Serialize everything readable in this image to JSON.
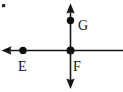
{
  "figure": {
    "background_color": "#ffffff",
    "ink_color": "#161616",
    "width": 123,
    "height": 92,
    "labels": {
      "e": "E",
      "f": "F",
      "g": "G"
    },
    "label_positions": {
      "e": {
        "x": 18,
        "y": 71
      },
      "f": {
        "x": 73,
        "y": 71
      },
      "g": {
        "x": 78,
        "y": 30
      }
    },
    "points": [
      {
        "name": "E",
        "x": 23,
        "y": 50.5,
        "radius": 3.7
      },
      {
        "name": "F",
        "x": 70.5,
        "y": 50.5,
        "radius": 4.0
      },
      {
        "name": "G",
        "x": 70.5,
        "y": 20.5,
        "radius": 3.7
      }
    ],
    "lines": [
      {
        "name": "horizontal-line",
        "x1": 3,
        "y1": 50.5,
        "x2": 123,
        "y2": 50.5,
        "arrow_start": true,
        "arrow_end": false
      },
      {
        "name": "vertical-line",
        "x1": 70.5,
        "y1": 4,
        "x2": 70.5,
        "y2": 88,
        "arrow_start": true,
        "arrow_end": true
      }
    ],
    "speck": {
      "x": 3,
      "y": 5,
      "size": 3
    }
  }
}
